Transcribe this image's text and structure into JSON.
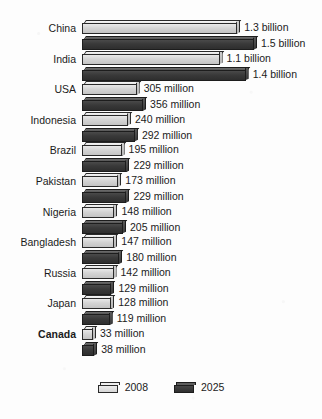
{
  "chart_data": {
    "type": "bar",
    "title": "",
    "xlabel": "",
    "ylabel": "",
    "orientation": "horizontal",
    "grid": false,
    "legend_position": "bottom-center",
    "categories": [
      "China",
      "India",
      "USA",
      "Indonesia",
      "Brazil",
      "Pakistan",
      "Nigeria",
      "Bangladesh",
      "Russia",
      "Japan",
      "Canada"
    ],
    "series": [
      {
        "name": "2008",
        "color": "#d4d4d4",
        "values": [
          1300,
          1100,
          305,
          240,
          195,
          173,
          148,
          147,
          142,
          128,
          33
        ],
        "labels": [
          "1.3 billion",
          "1.1 billion",
          "305 million",
          "240 million",
          "195 million",
          "173 million",
          "148 million",
          "147 million",
          "142 million",
          "128 million",
          "33 million"
        ]
      },
      {
        "name": "2025",
        "color": "#393939",
        "values": [
          1500,
          1400,
          356,
          292,
          229,
          229,
          205,
          180,
          129,
          119,
          38
        ],
        "labels": [
          "1.5 billion",
          "1.4 billion",
          "356 million",
          "292 million",
          "229 million",
          "229 million",
          "205 million",
          "180 million",
          "129 million",
          "119 million",
          "38 million"
        ]
      }
    ],
    "units": "millions of people",
    "highlighted_category": "Canada"
  },
  "legend": {
    "items": [
      {
        "label": "2008",
        "swatch": "light-bar-swatch"
      },
      {
        "label": "2025",
        "swatch": "dark-bar-swatch"
      }
    ]
  }
}
